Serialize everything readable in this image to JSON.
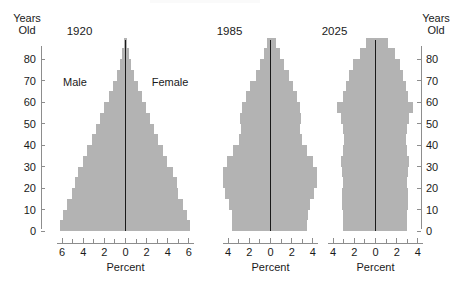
{
  "figure": {
    "type": "population-pyramid-panel",
    "background_color": "#ffffff",
    "bar_color": "#b3b3b3",
    "axis_color": "#8d8d8d",
    "center_line_color": "#1a1a1a"
  },
  "axes": {
    "y_axis_label_line1": "Years",
    "y_axis_label_line2": "Old",
    "y_ticks": [
      "0",
      "10",
      "20",
      "30",
      "40",
      "50",
      "60",
      "70",
      "80"
    ],
    "y_min": 0,
    "y_max": 88,
    "x_axis_label": "Percent"
  },
  "legend": {
    "male_label": "Male",
    "female_label": "Female"
  },
  "chart_data": {
    "type": "bar",
    "title": "",
    "subtitle": "",
    "xlabel": "Percent",
    "ylabel": "Years Old",
    "grid": false,
    "legend_position": "in-plot-panel-1",
    "orientation": "horizontal-mirrored",
    "age_group_width": 5,
    "categories": [
      "0-4",
      "5-9",
      "10-14",
      "15-19",
      "20-24",
      "25-29",
      "30-34",
      "35-39",
      "40-44",
      "45-49",
      "50-54",
      "55-59",
      "60-64",
      "65-69",
      "70-74",
      "75-79",
      "80-84",
      "85+"
    ],
    "panels": [
      {
        "name": "1920",
        "title": "1920",
        "xlim": [
          -7,
          7
        ],
        "x_ticks": [
          "6",
          "4",
          "2",
          "0",
          "2",
          "4",
          "6"
        ],
        "x_tick_values": [
          6,
          4,
          2,
          0,
          2,
          4,
          6
        ],
        "x_minor_tick_step": 1,
        "series": [
          {
            "name": "Male",
            "side": "left",
            "values": [
              6.2,
              5.9,
              5.5,
              5.1,
              4.8,
              4.5,
              4.0,
              3.6,
              3.2,
              2.8,
              2.4,
              2.0,
              1.6,
              1.2,
              0.85,
              0.5,
              0.3,
              0.12
            ]
          },
          {
            "name": "Female",
            "side": "right",
            "values": [
              6.1,
              5.8,
              5.4,
              5.0,
              4.9,
              4.5,
              3.9,
              3.5,
              3.1,
              2.7,
              2.3,
              1.9,
              1.55,
              1.2,
              0.85,
              0.5,
              0.3,
              0.12
            ]
          }
        ]
      },
      {
        "name": "1985",
        "title": "1985",
        "xlim": [
          -5,
          5
        ],
        "x_ticks": [
          "4",
          "2",
          "0",
          "2",
          "4"
        ],
        "x_tick_values": [
          4,
          2,
          0,
          2,
          4
        ],
        "x_minor_tick_step": 1,
        "series": [
          {
            "name": "Male",
            "side": "left",
            "values": [
              3.6,
              3.6,
              3.9,
              4.3,
              4.5,
              4.5,
              4.1,
              3.5,
              3.0,
              2.8,
              2.9,
              2.7,
              2.3,
              1.9,
              1.4,
              1.0,
              0.6,
              0.3
            ]
          },
          {
            "name": "Female",
            "side": "right",
            "values": [
              3.4,
              3.5,
              3.7,
              4.1,
              4.4,
              4.4,
              4.0,
              3.4,
              3.0,
              2.8,
              2.9,
              2.8,
              2.5,
              2.1,
              1.7,
              1.3,
              0.9,
              0.5
            ]
          }
        ]
      },
      {
        "name": "2025",
        "title": "2025",
        "xlim": [
          -5,
          5
        ],
        "x_ticks": [
          "4",
          "2",
          "0",
          "2",
          "4"
        ],
        "x_tick_values": [
          4,
          2,
          0,
          2,
          4
        ],
        "x_minor_tick_step": 1,
        "series": [
          {
            "name": "Male",
            "side": "left",
            "values": [
              3.1,
              3.1,
              3.2,
              3.2,
              3.1,
              3.2,
              3.3,
              3.1,
              3.0,
              3.1,
              3.3,
              3.6,
              3.1,
              2.8,
              2.5,
              2.1,
              1.5,
              0.9
            ]
          },
          {
            "name": "Female",
            "side": "right",
            "values": [
              3.0,
              3.0,
              3.1,
              3.1,
              3.0,
              3.1,
              3.2,
              3.0,
              2.9,
              3.0,
              3.2,
              3.5,
              3.1,
              2.9,
              2.6,
              2.3,
              1.8,
              1.2
            ]
          }
        ]
      }
    ]
  }
}
